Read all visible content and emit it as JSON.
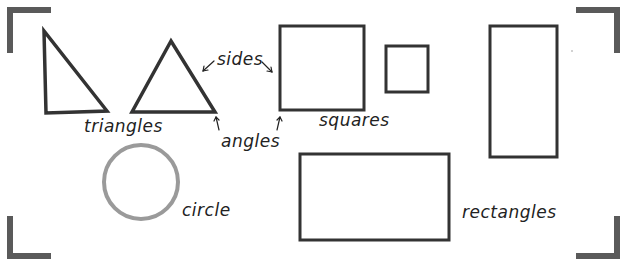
{
  "diagram": {
    "colors": {
      "background": "#ffffff",
      "shape_stroke": "#333333",
      "circle_stroke": "#9a9a9a",
      "bracket": "#5a5a5a",
      "text": "#222222"
    },
    "labels": {
      "triangles": "triangles",
      "sides": "sides",
      "angles": "angles",
      "squares": "squares",
      "circle": "circle",
      "rectangles": "rectangles"
    },
    "groups": [
      {
        "name": "triangles",
        "count": 2
      },
      {
        "name": "squares",
        "count": 2
      },
      {
        "name": "circle",
        "count": 1
      },
      {
        "name": "rectangles",
        "count": 2
      }
    ],
    "annotations": [
      {
        "text": "sides",
        "points_to": [
          "triangle side",
          "square side"
        ]
      },
      {
        "text": "angles",
        "points_to": [
          "triangle corner",
          "square corner"
        ]
      }
    ]
  }
}
